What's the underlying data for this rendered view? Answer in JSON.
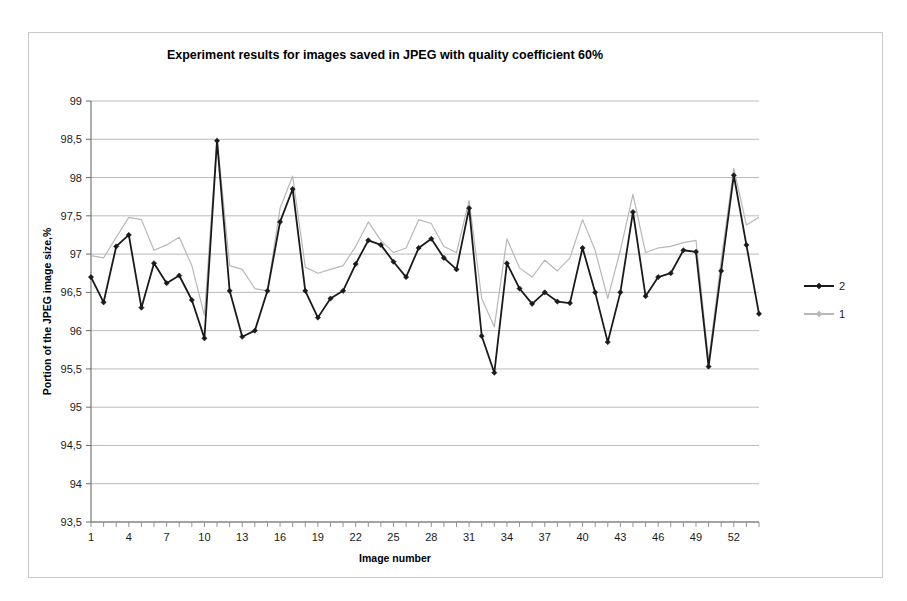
{
  "chart_data": {
    "type": "line",
    "title": "Experiment results for images saved in JPEG with quality coefficient 60%",
    "xlabel": "Image number",
    "ylabel": "Portion of the JPEG image size,%",
    "xlim": [
      1,
      54
    ],
    "ylim": [
      93.5,
      99
    ],
    "ytick_step": 0.5,
    "ytick_labels": [
      "93,5",
      "94",
      "94,5",
      "95",
      "95,5",
      "96",
      "96,5",
      "97",
      "97,5",
      "98",
      "98,5",
      "99"
    ],
    "ytick_values": [
      93.5,
      94,
      94.5,
      95,
      95.5,
      96,
      96.5,
      97,
      97.5,
      98,
      98.5,
      99
    ],
    "xtick_labels": [
      "1",
      "4",
      "7",
      "10",
      "13",
      "16",
      "19",
      "22",
      "25",
      "28",
      "31",
      "34",
      "37",
      "40",
      "43",
      "46",
      "49",
      "52"
    ],
    "xtick_values": [
      1,
      4,
      7,
      10,
      13,
      16,
      19,
      22,
      25,
      28,
      31,
      34,
      37,
      40,
      43,
      46,
      49,
      52
    ],
    "xtick_minor_step": 1,
    "grid": "horizontal",
    "legend_position": "right",
    "x": [
      1,
      2,
      3,
      4,
      5,
      6,
      7,
      8,
      9,
      10,
      11,
      12,
      13,
      14,
      15,
      16,
      17,
      18,
      19,
      20,
      21,
      22,
      23,
      24,
      25,
      26,
      27,
      28,
      29,
      30,
      31,
      32,
      33,
      34,
      35,
      36,
      37,
      38,
      39,
      40,
      41,
      42,
      43,
      44,
      45,
      46,
      47,
      48,
      49,
      50,
      51,
      52,
      53,
      54
    ],
    "series": [
      {
        "name": "2",
        "color": "#1a1a1a",
        "marker": "diamond",
        "line_width": 1.8,
        "values": [
          96.7,
          96.37,
          97.1,
          97.25,
          96.3,
          96.88,
          96.62,
          96.72,
          96.4,
          95.9,
          98.48,
          96.52,
          95.92,
          96.0,
          96.52,
          97.42,
          97.85,
          96.52,
          96.17,
          96.42,
          96.52,
          96.87,
          97.18,
          97.12,
          96.9,
          96.7,
          97.08,
          97.2,
          96.95,
          96.8,
          97.6,
          95.93,
          95.45,
          96.88,
          96.55,
          96.35,
          96.5,
          96.38,
          96.36,
          97.08,
          96.5,
          95.85,
          96.5,
          97.55,
          96.45,
          96.7,
          96.75,
          97.05,
          97.03,
          95.53,
          96.78,
          98.03,
          97.12,
          96.22
        ]
      },
      {
        "name": "1",
        "color": "#b8b8b8",
        "marker": "none",
        "line_width": 1.2,
        "values": [
          96.98,
          96.95,
          97.22,
          97.48,
          97.45,
          97.05,
          97.12,
          97.22,
          96.85,
          96.2,
          98.52,
          96.85,
          96.8,
          96.55,
          96.52,
          97.6,
          98.02,
          96.83,
          96.75,
          96.8,
          96.85,
          97.1,
          97.42,
          97.18,
          97.02,
          97.08,
          97.45,
          97.4,
          97.1,
          97.02,
          97.7,
          96.42,
          96.05,
          97.2,
          96.82,
          96.7,
          96.92,
          96.78,
          96.95,
          97.45,
          97.05,
          96.42,
          97.05,
          97.78,
          97.02,
          97.08,
          97.1,
          97.15,
          97.18,
          95.6,
          96.92,
          98.12,
          97.38,
          97.48
        ]
      }
    ],
    "legend": [
      {
        "label": "2",
        "color": "#1a1a1a",
        "marker": "diamond"
      },
      {
        "label": "1",
        "color": "#b8b8b8",
        "marker": "diamond"
      }
    ]
  }
}
